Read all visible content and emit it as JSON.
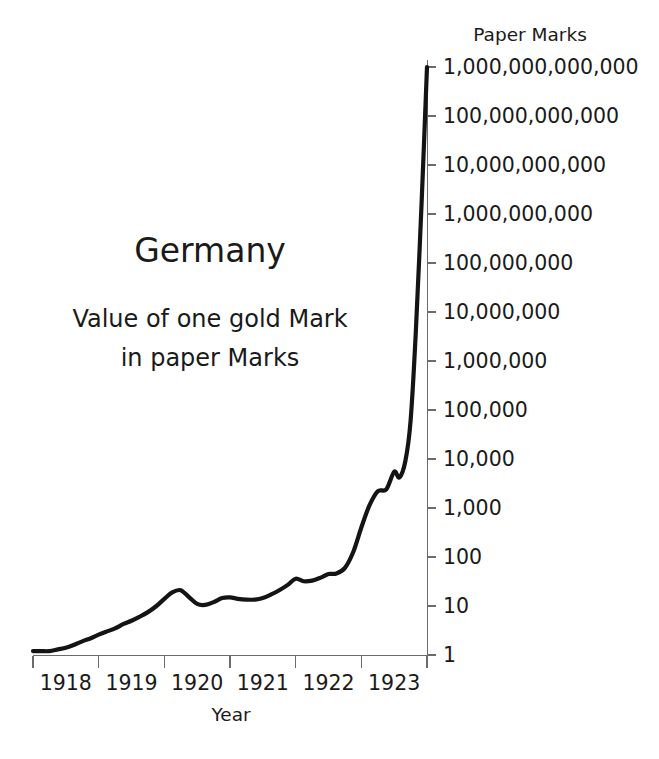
{
  "chart_data": {
    "type": "line",
    "title": "Germany",
    "subtitle_line1": "Value of one gold Mark",
    "subtitle_line2": "in paper Marks",
    "unit_header": "Paper Marks",
    "xlabel": "Year",
    "ylabel": "",
    "yscale": "log",
    "ylim": [
      1,
      1000000000000
    ],
    "xlim": [
      1917.5,
      1923.5
    ],
    "grid": false,
    "legend": null,
    "ytick_labels": [
      "1,000,000,000,000",
      "100,000,000,000",
      "10,000,000,000",
      "1,000,000,000",
      "100,000,000",
      "10,000,000",
      "1,000,000",
      "100,000",
      "10,000",
      "1,000",
      "100",
      "10",
      "1"
    ],
    "ytick_values": [
      1000000000000,
      100000000000,
      10000000000,
      1000000000,
      100000000,
      10000000,
      1000000,
      100000,
      10000,
      1000,
      100,
      10,
      1
    ],
    "xtick_labels": [
      "1918",
      "1919",
      "1920",
      "1921",
      "1922",
      "1923"
    ],
    "xtick_values": [
      1918,
      1919,
      1920,
      1921,
      1922,
      1923
    ],
    "series": [
      {
        "name": "Value of one gold Mark in paper Marks",
        "color": "#141414",
        "x": [
          1917.5,
          1917.62,
          1917.75,
          1917.88,
          1918.0,
          1918.12,
          1918.25,
          1918.38,
          1918.5,
          1918.62,
          1918.75,
          1918.88,
          1919.0,
          1919.12,
          1919.25,
          1919.38,
          1919.5,
          1919.62,
          1919.75,
          1919.88,
          1920.0,
          1920.12,
          1920.25,
          1920.38,
          1920.5,
          1920.62,
          1920.75,
          1920.88,
          1921.0,
          1921.12,
          1921.25,
          1921.38,
          1921.5,
          1921.62,
          1921.75,
          1921.88,
          1922.0,
          1922.12,
          1922.25,
          1922.38,
          1922.5,
          1922.62,
          1922.75,
          1922.88,
          1923.0,
          1923.08,
          1923.17,
          1923.25,
          1923.33,
          1923.42,
          1923.5
        ],
        "y": [
          1.2,
          1.2,
          1.2,
          1.3,
          1.4,
          1.6,
          1.9,
          2.2,
          2.6,
          3.0,
          3.5,
          4.3,
          5.0,
          6.0,
          7.5,
          10.0,
          14.0,
          19.0,
          21.0,
          15.0,
          11.0,
          10.5,
          12.0,
          14.5,
          15.0,
          14.0,
          13.5,
          13.5,
          14.5,
          17.0,
          21.0,
          27.0,
          36.0,
          32.0,
          33.0,
          38.0,
          45.0,
          46.0,
          60.0,
          130.0,
          400.0,
          1100.0,
          2200.0,
          2400.0,
          5500.0,
          4200.0,
          9000.0,
          60000.0,
          4000000.0,
          2000000000.0,
          1000000000000.0
        ],
        "annotations": [
          {
            "label": "local peak",
            "x": 1919.75,
            "y": 21
          },
          {
            "label": "hyperinflation onset",
            "x": 1922.5,
            "y": 400
          },
          {
            "label": "collapse",
            "x": 1923.5,
            "y": 1000000000000
          }
        ]
      }
    ]
  },
  "layout": {
    "plot_left": 33,
    "plot_right": 427,
    "plot_top": 67,
    "plot_bottom": 655,
    "title_x": 210,
    "title_y": 262,
    "subtitle1_y": 327,
    "subtitle2_y": 366,
    "unit_header_x": 530,
    "unit_header_y": 41,
    "xlabel_x": 231,
    "xlabel_y": 721
  }
}
